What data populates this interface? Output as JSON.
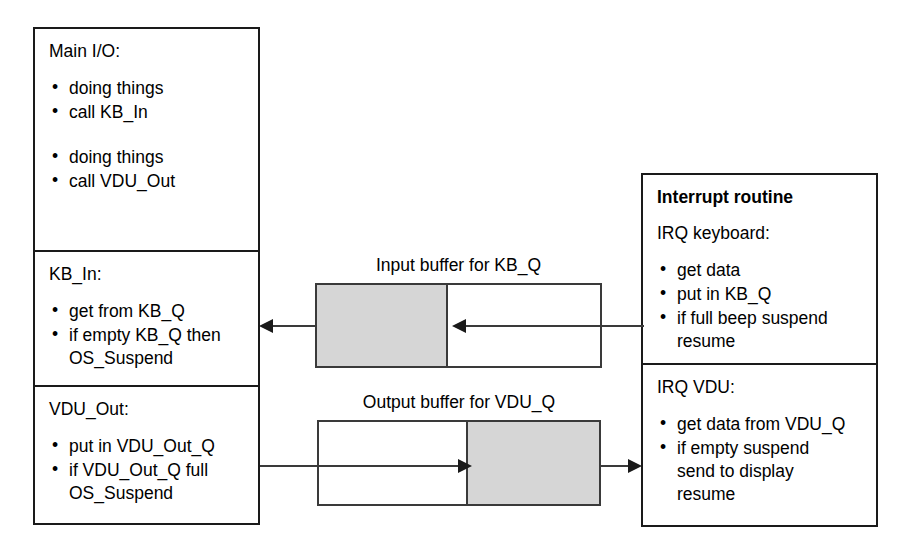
{
  "diagram": {
    "colors": {
      "stroke": "#1a1a1a",
      "buffer_stroke": "#3a3a3a",
      "buffer_fill": "#d6d6d6",
      "background": "#ffffff"
    }
  },
  "left_panel": {
    "sections": [
      {
        "heading": "Main I/O:",
        "bullets": [
          "doing things",
          "call KB_In",
          "",
          "doing things",
          "call VDU_Out"
        ]
      },
      {
        "heading": "KB_In:",
        "bullets": [
          "get from KB_Q",
          "if empty KB_Q then\nOS_Suspend"
        ]
      },
      {
        "heading": "VDU_Out:",
        "bullets": [
          "put in VDU_Out_Q",
          "if VDU_Out_Q full\nOS_Suspend"
        ]
      }
    ]
  },
  "right_panel": {
    "sections": [
      {
        "title": "Interrupt routine",
        "heading": "IRQ keyboard:",
        "bullets": [
          "get data",
          "put in KB_Q",
          "if full beep suspend\nresume"
        ]
      },
      {
        "title": "",
        "heading": "IRQ VDU:",
        "bullets": [
          "get data from VDU_Q",
          "if empty suspend\nsend to display\nresume"
        ]
      }
    ]
  },
  "buffers": [
    {
      "label": "Input buffer for KB_Q",
      "fill_side": "left",
      "fill_percent": 46,
      "flow_direction": "right-to-left"
    },
    {
      "label": "Output buffer for VDU_Q",
      "fill_side": "right",
      "fill_percent": 47,
      "flow_direction": "left-to-right"
    }
  ],
  "bullet_glyph": "•"
}
